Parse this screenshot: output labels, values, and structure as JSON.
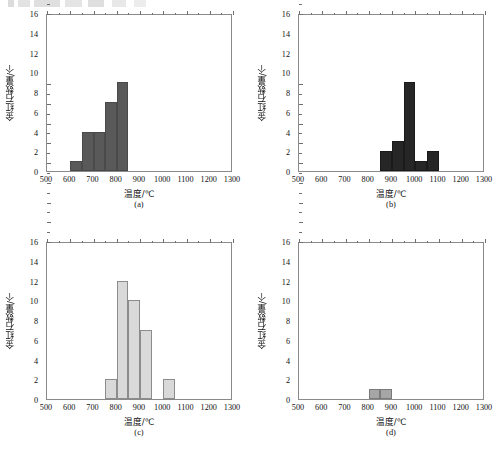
{
  "figure": {
    "header_artifact": "",
    "axis": {
      "x_title": "温度/℃",
      "y_title": "金红石数量/个",
      "x_ticks": [
        500,
        600,
        700,
        800,
        900,
        1000,
        1100,
        1200,
        1300
      ],
      "y_ticks": [
        0,
        2,
        4,
        6,
        8,
        10,
        12,
        14,
        16
      ],
      "xlim": [
        500,
        1300
      ],
      "ylim": [
        0,
        16
      ]
    },
    "panels": [
      {
        "id": "a",
        "caption": "(a)",
        "bar_color": "#595959",
        "bar_border": "#4a4a4a"
      },
      {
        "id": "b",
        "caption": "(b)",
        "bar_color": "#262626",
        "bar_border": "#1a1a1a"
      },
      {
        "id": "c",
        "caption": "(c)",
        "bar_color": "#d9d9d9",
        "bar_border": "#8c8c8c"
      },
      {
        "id": "d",
        "caption": "(d)",
        "bar_color": "#a6a6a6",
        "bar_border": "#7a7a7a"
      }
    ]
  },
  "chart_data": [
    {
      "type": "bar",
      "panel": "a",
      "title": "(a)",
      "xlabel": "温度/℃",
      "ylabel": "金红石数量/个",
      "xlim": [
        500,
        1300
      ],
      "ylim": [
        0,
        16
      ],
      "bin_width": 50,
      "grid": false,
      "legend": "none",
      "bin_starts": [
        600,
        650,
        700,
        750,
        800
      ],
      "categories": [
        "600-650",
        "650-700",
        "700-750",
        "750-800",
        "800-850"
      ],
      "values": [
        1,
        4,
        4,
        7,
        9
      ]
    },
    {
      "type": "bar",
      "panel": "b",
      "title": "(b)",
      "xlabel": "温度/℃",
      "ylabel": "金红石数量/个",
      "xlim": [
        500,
        1300
      ],
      "ylim": [
        0,
        16
      ],
      "bin_width": 50,
      "grid": false,
      "legend": "none",
      "bin_starts": [
        850,
        900,
        950,
        1000,
        1050
      ],
      "categories": [
        "850-900",
        "900-950",
        "950-1000",
        "1000-1050",
        "1050-1100"
      ],
      "values": [
        2,
        3,
        9,
        1,
        2
      ]
    },
    {
      "type": "bar",
      "panel": "c",
      "title": "(c)",
      "xlabel": "温度/℃",
      "ylabel": "金红石数量/个",
      "xlim": [
        500,
        1300
      ],
      "ylim": [
        0,
        16
      ],
      "bin_width": 50,
      "grid": false,
      "legend": "none",
      "bin_starts": [
        750,
        800,
        850,
        900,
        1000
      ],
      "categories": [
        "750-800",
        "800-850",
        "850-900",
        "900-950",
        "1000-1050"
      ],
      "values": [
        2,
        12,
        10,
        7,
        2
      ]
    },
    {
      "type": "bar",
      "panel": "d",
      "title": "(d)",
      "xlabel": "温度/℃",
      "ylabel": "金红石数量/个",
      "xlim": [
        500,
        1300
      ],
      "ylim": [
        0,
        16
      ],
      "bin_width": 50,
      "grid": false,
      "legend": "none",
      "bin_starts": [
        800,
        850
      ],
      "categories": [
        "800-850",
        "850-900"
      ],
      "values": [
        1,
        1
      ]
    }
  ]
}
